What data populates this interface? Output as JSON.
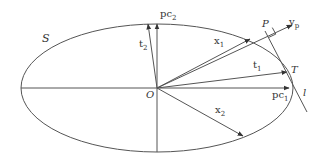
{
  "diagram": {
    "type": "geometric-vector-diagram",
    "colors": {
      "stroke": "#444444",
      "background": "#ffffff",
      "text": "#333333"
    },
    "labels": {
      "S": "S",
      "O": "O",
      "P": "P",
      "T": "T",
      "l": "l",
      "pc1": {
        "base": "pc",
        "sub": "1"
      },
      "pc2": {
        "base": "pc",
        "sub": "2"
      },
      "t1": {
        "base": "t",
        "sub": "1"
      },
      "t2": {
        "base": "t",
        "sub": "2"
      },
      "x1": {
        "base": "x",
        "sub": "1"
      },
      "x2": {
        "base": "x",
        "sub": "2"
      },
      "yp": {
        "base": "y",
        "sub": "p"
      }
    },
    "elements": {
      "ellipse": {
        "cx": 157,
        "cy": 88,
        "rx": 136,
        "ry": 64
      },
      "origin": {
        "x": 157,
        "y": 88
      },
      "axes": [
        {
          "name": "horizontal-axis",
          "from": [
            21,
            88
          ],
          "to": [
            157,
            88
          ]
        },
        {
          "name": "vertical-axis",
          "from": [
            157,
            88
          ],
          "to": [
            157,
            152
          ]
        }
      ],
      "vectors": [
        {
          "name": "pc1",
          "from": [
            157,
            88
          ],
          "to": [
            289,
            88
          ]
        },
        {
          "name": "pc2",
          "from": [
            157,
            88
          ],
          "to": [
            157,
            24
          ]
        },
        {
          "name": "t1",
          "from": [
            157,
            88
          ],
          "to": [
            287,
            72
          ]
        },
        {
          "name": "t2",
          "from": [
            157,
            88
          ],
          "to": [
            148,
            24
          ]
        },
        {
          "name": "x1",
          "from": [
            157,
            88
          ],
          "to": [
            250,
            39
          ]
        },
        {
          "name": "x2",
          "from": [
            157,
            88
          ],
          "to": [
            243,
            136
          ]
        },
        {
          "name": "yp",
          "from": [
            157,
            88
          ],
          "to": [
            292,
            25
          ]
        }
      ],
      "lines": [
        {
          "name": "tangent-l",
          "from": [
            265,
            31
          ],
          "to": [
            307,
            112
          ]
        }
      ]
    }
  }
}
